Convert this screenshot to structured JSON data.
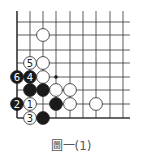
{
  "diagram": {
    "caption": "圖一(1)",
    "grid": {
      "x_lines": [
        17,
        30,
        43,
        56,
        70,
        83,
        96,
        110,
        123
      ],
      "y_lines": [
        22,
        35,
        50,
        63,
        77,
        90,
        104,
        118
      ],
      "top_extent": 11,
      "right_extent": 130,
      "left_edge": true,
      "bottom_edge": true
    },
    "stones": [
      {
        "color": "white",
        "col": 2,
        "row": 1,
        "label": ""
      },
      {
        "color": "white",
        "col": 1,
        "row": 3,
        "label": "5"
      },
      {
        "color": "white",
        "col": 2,
        "row": 3,
        "label": ""
      },
      {
        "color": "black",
        "col": 0,
        "row": 4,
        "label": "6"
      },
      {
        "color": "black",
        "col": 1,
        "row": 4,
        "label": "4"
      },
      {
        "color": "white",
        "col": 2,
        "row": 4,
        "label": ""
      },
      {
        "color": "black",
        "col": 1,
        "row": 5,
        "label": ""
      },
      {
        "color": "black",
        "col": 2,
        "row": 5,
        "label": ""
      },
      {
        "color": "white",
        "col": 3,
        "row": 5,
        "label": ""
      },
      {
        "color": "white",
        "col": 4,
        "row": 5,
        "label": ""
      },
      {
        "color": "black",
        "col": 0,
        "row": 6,
        "label": "2"
      },
      {
        "color": "white",
        "col": 1,
        "row": 6,
        "label": "1"
      },
      {
        "color": "black",
        "col": 3,
        "row": 6,
        "label": ""
      },
      {
        "color": "white",
        "col": 4,
        "row": 6,
        "label": ""
      },
      {
        "color": "white",
        "col": 6,
        "row": 6,
        "label": ""
      },
      {
        "color": "white",
        "col": 1,
        "row": 7,
        "label": "3"
      },
      {
        "color": "black",
        "col": 2,
        "row": 7,
        "label": ""
      }
    ],
    "markers": [
      {
        "type": "dot",
        "col": 3,
        "row": 4
      }
    ],
    "colors": {
      "line": "#333333",
      "black_stone": "#1a1a1a",
      "white_stone": "#ffffff",
      "stone_outline": "#222222"
    }
  }
}
